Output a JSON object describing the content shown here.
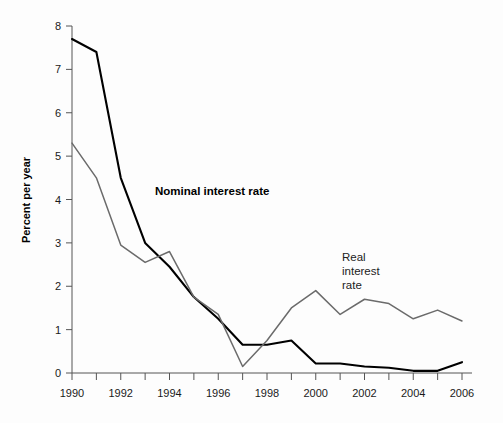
{
  "chart_data": {
    "type": "line",
    "title": "",
    "subtitle": "",
    "xlabel": "",
    "ylabel": "Percent per year",
    "xlim": [
      1990,
      2006
    ],
    "ylim": [
      0,
      8
    ],
    "grid": false,
    "legend_position": "inline-annotations",
    "x": [
      1990,
      1991,
      1992,
      1993,
      1994,
      1995,
      1996,
      1997,
      1998,
      1999,
      2000,
      2001,
      2002,
      2003,
      2004,
      2005,
      2006
    ],
    "y_ticks": [
      0,
      1,
      2,
      3,
      4,
      5,
      6,
      7,
      8
    ],
    "y_tick_labels": [
      "0",
      "1",
      "2",
      "3",
      "4",
      "5",
      "6",
      "7",
      "8"
    ],
    "x_ticks": [
      1990,
      1991,
      1992,
      1993,
      1994,
      1995,
      1996,
      1997,
      1998,
      1999,
      2000,
      2001,
      2002,
      2003,
      2004,
      2005,
      2006
    ],
    "x_tick_labels": [
      "1990",
      "",
      "1992",
      "",
      "1994",
      "",
      "1996",
      "",
      "1998",
      "",
      "2000",
      "",
      "2002",
      "",
      "2004",
      "",
      "2006"
    ],
    "x_labeled_ticks": [
      "1990",
      "1992",
      "1994",
      "1996",
      "1998",
      "2000",
      "2002",
      "2004",
      "2006"
    ],
    "series": [
      {
        "name": "Nominal interest rate",
        "color": "#000000",
        "linewidth": 2.1,
        "label_text": "Nominal interest rate",
        "values": [
          7.7,
          7.4,
          4.5,
          3.0,
          2.45,
          1.75,
          1.25,
          0.65,
          0.65,
          0.75,
          0.22,
          0.22,
          0.15,
          0.12,
          0.05,
          0.05,
          0.25
        ]
      },
      {
        "name": "Real interest rate",
        "color": "#6b6b6b",
        "linewidth": 1.5,
        "label_text": "Real interest rate",
        "label_lines": [
          "Real",
          "interest",
          "rate"
        ],
        "values": [
          5.3,
          4.5,
          2.95,
          2.55,
          2.8,
          1.75,
          1.35,
          0.15,
          0.75,
          1.5,
          1.9,
          1.35,
          1.7,
          1.6,
          1.25,
          1.45,
          1.2
        ]
      }
    ]
  },
  "annotations": {
    "nominal_label": "Nominal interest rate",
    "real_label_line1": "Real",
    "real_label_line2": "interest",
    "real_label_line3": "rate"
  },
  "axes": {
    "y_title": "Percent per year"
  },
  "colors": {
    "background": "#fdfdfd",
    "axis": "#555555",
    "nominal_series": "#000000",
    "real_series": "#6b6b6b",
    "text": "#1a1a1a"
  }
}
